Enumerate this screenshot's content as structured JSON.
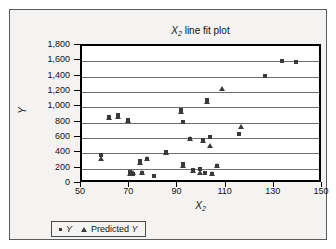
{
  "chart_data": {
    "type": "scatter",
    "title": "X2 line fit plot",
    "title_parts": {
      "var": "X",
      "sub": "2",
      "rest": " line fit plot"
    },
    "xlabel": "X2",
    "xlabel_parts": {
      "var": "X",
      "sub": "2"
    },
    "ylabel": "Y",
    "xlim": [
      50,
      150
    ],
    "ylim": [
      0,
      1800
    ],
    "xticks": [
      "50",
      "70",
      "90",
      "110",
      "130",
      "150"
    ],
    "xtick_values": [
      50,
      70,
      90,
      110,
      130,
      150
    ],
    "yticks": [
      "0",
      "200",
      "400",
      "600",
      "800",
      "1,000",
      "1,200",
      "1,400",
      "1,600",
      "1,800"
    ],
    "ytick_values": [
      0,
      200,
      400,
      600,
      800,
      1000,
      1200,
      1400,
      1600,
      1800
    ],
    "grid": "horizontal",
    "legend_position": "bottom",
    "series": [
      {
        "name": "Y",
        "marker": "square",
        "color": "#3a3a3a",
        "points": [
          [
            58,
            380
          ],
          [
            61,
            870
          ],
          [
            65,
            900
          ],
          [
            69,
            840
          ],
          [
            70,
            155
          ],
          [
            71,
            130
          ],
          [
            74,
            300
          ],
          [
            75,
            150
          ],
          [
            77,
            330
          ],
          [
            80,
            100
          ],
          [
            85,
            420
          ],
          [
            91,
            960
          ],
          [
            92,
            260
          ],
          [
            92,
            810
          ],
          [
            95,
            590
          ],
          [
            96,
            185
          ],
          [
            99,
            200
          ],
          [
            100,
            580
          ],
          [
            101,
            145
          ],
          [
            102,
            1090
          ],
          [
            103,
            615
          ],
          [
            104,
            135
          ],
          [
            106,
            230
          ],
          [
            115,
            655
          ],
          [
            126,
            1405
          ],
          [
            133,
            1600
          ],
          [
            139,
            1585
          ]
        ]
      },
      {
        "name": "Predicted Y",
        "marker": "triangle",
        "color": "#3a3a3a",
        "points": [
          [
            58,
            330
          ],
          [
            61,
            860
          ],
          [
            65,
            880
          ],
          [
            69,
            825
          ],
          [
            70,
            135
          ],
          [
            71,
            145
          ],
          [
            74,
            275
          ],
          [
            75,
            145
          ],
          [
            77,
            325
          ],
          [
            85,
            405
          ],
          [
            91,
            935
          ],
          [
            92,
            240
          ],
          [
            95,
            590
          ],
          [
            96,
            175
          ],
          [
            99,
            150
          ],
          [
            100,
            565
          ],
          [
            102,
            1075
          ],
          [
            103,
            490
          ],
          [
            104,
            130
          ],
          [
            106,
            230
          ],
          [
            108,
            1235
          ],
          [
            116,
            745
          ]
        ]
      }
    ]
  },
  "legend": {
    "entries": [
      {
        "label": "Y",
        "marker": "square"
      },
      {
        "label": "Predicted Y",
        "marker": "triangle"
      }
    ]
  }
}
